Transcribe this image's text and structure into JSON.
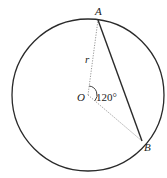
{
  "diagram": {
    "center_label": "O",
    "point_a_label": "A",
    "point_b_label": "B",
    "radius_label": "r",
    "angle_label": "120°",
    "central_angle_degrees": 120,
    "colors": {
      "stroke": "#2a2a2a",
      "dotted": "#8a8a8a",
      "background": "#ffffff"
    }
  }
}
